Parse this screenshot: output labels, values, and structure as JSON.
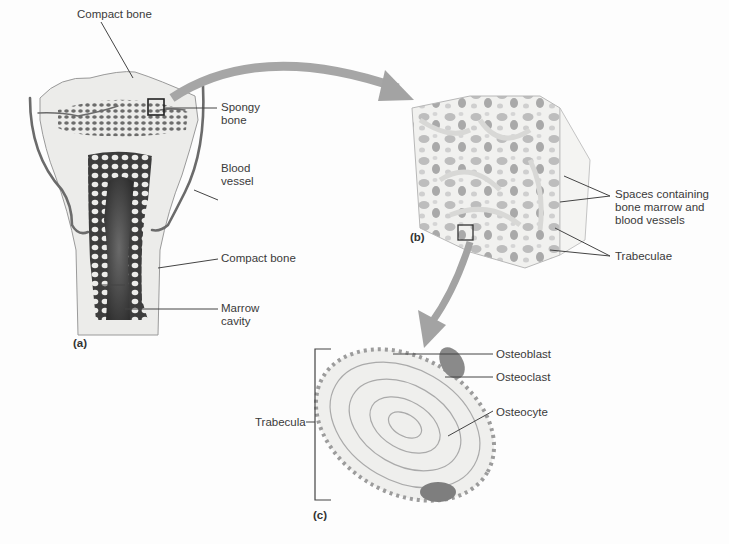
{
  "figure": {
    "panels": [
      {
        "id": "a",
        "label": "(a)",
        "subject": "Long bone section"
      },
      {
        "id": "b",
        "label": "(b)",
        "subject": "Spongy bone block"
      },
      {
        "id": "c",
        "label": "(c)",
        "subject": "Trabecula cross-section"
      }
    ],
    "labels": {
      "compact_bone_top": "Compact bone",
      "spongy_bone_1": "Spongy",
      "spongy_bone_2": "bone",
      "blood_vessel_1": "Blood",
      "blood_vessel_2": "vessel",
      "compact_bone_mid": "Compact bone",
      "marrow_cavity_1": "Marrow",
      "marrow_cavity_2": "cavity",
      "spaces_1": "Spaces containing",
      "spaces_2": "bone marrow and",
      "spaces_3": "blood vessels",
      "trabeculae": "Trabeculae",
      "osteoblast": "Osteoblast",
      "osteoclast": "Osteoclast",
      "osteocyte": "Osteocyte",
      "trabecula": "Trabecula"
    },
    "colors": {
      "bone": "#e9e9e6",
      "spongy": "#5a5a5a",
      "marrow": "#4a4a4a",
      "vessel": "#6b6b6b",
      "arrow": "#a3a3a3",
      "leader": "#444444",
      "cell": "#8a8a8a"
    }
  }
}
